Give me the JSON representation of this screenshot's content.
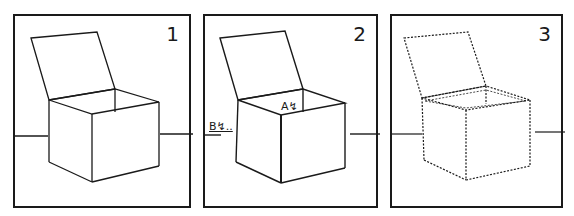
{
  "panels": [
    {
      "number": "1",
      "style": "solid",
      "labels": []
    },
    {
      "number": "2",
      "style": "solid",
      "labels": [
        {
          "text": "A↯"
        },
        {
          "text": "B↯.."
        }
      ]
    },
    {
      "number": "3",
      "style": "dotted",
      "labels": []
    }
  ],
  "colors": {
    "ink": "#1a1a1a",
    "background": "#ffffff"
  }
}
